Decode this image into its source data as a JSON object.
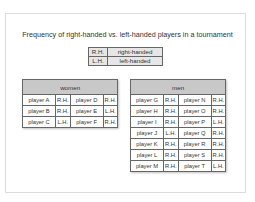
{
  "title": "Frequency of right-handed vs. left-handed players in a tournament",
  "legend": [
    {
      "abbr": "R.H.",
      "meaning": "right-handed"
    },
    {
      "abbr": "L.H.",
      "meaning": "left-handed"
    }
  ],
  "women": {
    "header": "women",
    "rows": [
      [
        "player A",
        "R.H.",
        "player D",
        "R.H."
      ],
      [
        "player B",
        "R.H.",
        "player E",
        "L.H."
      ],
      [
        "player C",
        "L.H.",
        "player F",
        "R.H."
      ]
    ]
  },
  "men": {
    "header": "men",
    "rows": [
      [
        "player G",
        "R.H.",
        "player N",
        "R.H."
      ],
      [
        "player H",
        "R.H.",
        "player O",
        "R.H."
      ],
      [
        "player I",
        "R.H.",
        "player P",
        "L.H."
      ],
      [
        "player J",
        "L.H.",
        "player Q",
        "R.H."
      ],
      [
        "player K",
        "R.H.",
        "player R",
        "R.H."
      ],
      [
        "player L",
        "R.H.",
        "player S",
        "R.H."
      ],
      [
        "player M",
        "R.H.",
        "player T",
        "L.H."
      ]
    ]
  }
}
